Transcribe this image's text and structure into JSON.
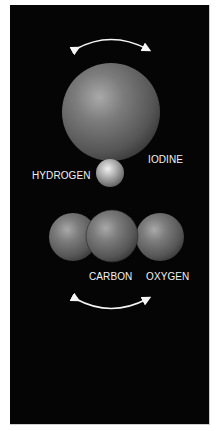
{
  "diagram": {
    "title": "",
    "colors": {
      "background": "#050505",
      "sphere_base": "#6e6e6e",
      "sphere_highlight": "#b8b8b8",
      "arrow": "#f5f5f5",
      "label": "#f2f2f2"
    },
    "molecules": [
      {
        "name": "hydrogen-iodide",
        "atoms": [
          {
            "label": "IODINE",
            "cx": 111,
            "cy": 112,
            "r": 49
          },
          {
            "label": "HYDROGEN",
            "cx": 110,
            "cy": 173,
            "r": 14
          }
        ],
        "motion_arrow": "top-curved-double-arrow"
      },
      {
        "name": "carbon-dioxide",
        "atoms": [
          {
            "label": "OXYGEN",
            "cx": 73,
            "cy": 237,
            "r": 24
          },
          {
            "label": "CARBON",
            "cx": 112,
            "cy": 236,
            "r": 26
          },
          {
            "label": "OXYGEN",
            "cx": 160,
            "cy": 237,
            "r": 24
          }
        ],
        "motion_arrow": "bottom-curved-double-arrow"
      }
    ],
    "labels": {
      "hydrogen": "HYDROGEN",
      "iodine": "IODINE",
      "carbon": "CARBON",
      "oxygen": "OXYGEN"
    }
  }
}
